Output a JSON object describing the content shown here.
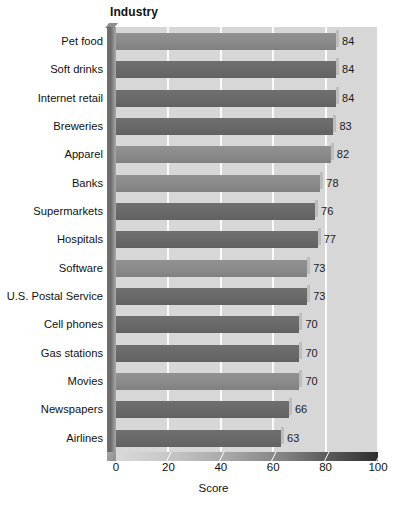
{
  "chart_data": {
    "type": "bar",
    "orientation": "horizontal",
    "title": "Industry",
    "xlabel": "Score",
    "ylabel": "",
    "xlim": [
      0,
      100
    ],
    "xticks": [
      0,
      20,
      40,
      60,
      80,
      100
    ],
    "grid": "vertical-white-gridlines",
    "legend": "none",
    "categories": [
      "Pet food",
      "Soft drinks",
      "Internet retail",
      "Breweries",
      "Apparel",
      "Banks",
      "Supermarkets",
      "Hospitals",
      "Software",
      "U.S. Postal Service",
      "Cell phones",
      "Gas stations",
      "Movies",
      "Newspapers",
      "Airlines"
    ],
    "values": [
      84,
      84,
      84,
      83,
      82,
      78,
      76,
      77,
      73,
      73,
      70,
      70,
      70,
      66,
      63
    ],
    "value_labels": [
      "84",
      "84",
      "84",
      "83",
      "82",
      "78",
      "76",
      "77",
      "73",
      "73",
      "70",
      "70",
      "70",
      "66",
      "63"
    ],
    "bar_shades": [
      "mid",
      "dark",
      "dark",
      "dark",
      "mid",
      "mid",
      "dark",
      "dark",
      "mid",
      "dark",
      "dark",
      "dark",
      "mid",
      "dark",
      "dark"
    ]
  },
  "colors": {
    "plot_background": "#d7d7d7",
    "gridline": "#fbfbfb",
    "bar_mid": "#8a8a8a",
    "bar_dark": "#696969",
    "axis_wall": "#6a6a6a",
    "text": "#111111",
    "page_background": "#ffffff"
  },
  "axis": {
    "tick_labels": [
      "0",
      "20",
      "40",
      "60",
      "80",
      "100"
    ],
    "title": "Score"
  }
}
